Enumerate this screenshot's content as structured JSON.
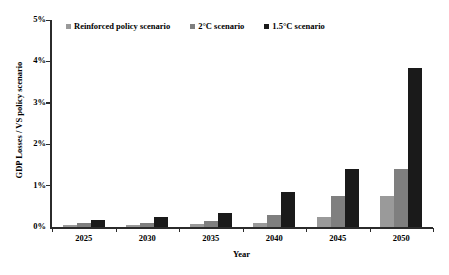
{
  "chart_data": {
    "type": "bar",
    "title": "",
    "xlabel": "Year",
    "ylabel": "GDP Losses / VS policy scenario",
    "categories": [
      "2025",
      "2030",
      "2035",
      "2040",
      "2045",
      "2050"
    ],
    "ytick_labels": [
      "0%",
      "1%",
      "2%",
      "3%",
      "4%",
      "5%"
    ],
    "ytick_values": [
      0,
      1,
      2,
      3,
      4,
      5
    ],
    "ylim": [
      0,
      5
    ],
    "yunit": "%",
    "grid": false,
    "legend_position": "top",
    "series": [
      {
        "name": "Reinforced policy scenario",
        "color": "#9a9a9a",
        "values": [
          0.05,
          0.05,
          0.07,
          0.1,
          0.25,
          0.75
        ]
      },
      {
        "name": "2°C scenario",
        "color": "#7f7f7f",
        "values": [
          0.1,
          0.1,
          0.15,
          0.3,
          0.75,
          1.4
        ]
      },
      {
        "name": "1.5°C scenario",
        "color": "#1a1a1a",
        "values": [
          0.18,
          0.25,
          0.33,
          0.85,
          1.4,
          3.84
        ]
      }
    ]
  }
}
